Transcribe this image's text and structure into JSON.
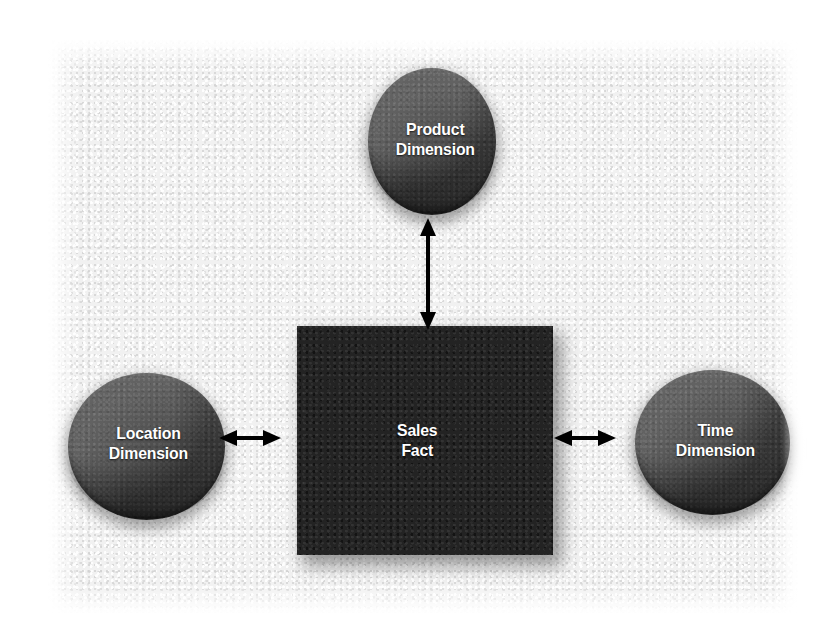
{
  "diagram": {
    "background_color": "#f1f1f1",
    "page_color": "#ffffff",
    "fact_color": "#232323",
    "dimension_color": "#4b4b4b",
    "label_color": "#ffffff",
    "arrow_color": "#000000",
    "nodes": {
      "fact": {
        "label": "Sales\nFact",
        "shape": "square"
      },
      "product": {
        "label": "Product\nDimension",
        "shape": "circle"
      },
      "location": {
        "label": "Location\nDimension",
        "shape": "circle"
      },
      "time": {
        "label": "Time\nDimension",
        "shape": "circle"
      }
    },
    "connections": [
      {
        "from": "product",
        "to": "fact",
        "style": "double-arrow",
        "orientation": "vertical"
      },
      {
        "from": "location",
        "to": "fact",
        "style": "double-arrow",
        "orientation": "horizontal"
      },
      {
        "from": "fact",
        "to": "time",
        "style": "double-arrow",
        "orientation": "horizontal"
      }
    ]
  }
}
